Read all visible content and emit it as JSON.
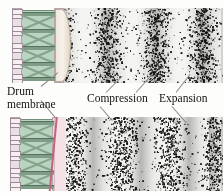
{
  "figure": {
    "type": "physics-illustration",
    "background_color": "#fdfdfc"
  },
  "labels": {
    "drum_membrane_line1": "Drum",
    "drum_membrane_line2": "membrane",
    "compression": "Compression",
    "expansion": "Expansion"
  },
  "panels": [
    {
      "id": "top",
      "name": "membrane-pushed-outward",
      "membrane_state": "bulged-outward",
      "membrane_shape": "convex",
      "membrane_color": "#efe7dd",
      "band_offset_px": 0
    },
    {
      "id": "bottom",
      "name": "membrane-pulled-inward",
      "membrane_state": "pulled-inward",
      "membrane_shape": "slanted-flat",
      "membrane_color": "#f4e2e6",
      "band_offset_px": 14
    }
  ],
  "drum": {
    "name": "drum-body",
    "shell_color": "#b9d4c0",
    "rail_color": "#eadfe4",
    "brace_color": "#86a48d",
    "hbar_color": "#7e9c86",
    "hoop_count": 4,
    "brace_cells": 4
  },
  "wave": {
    "medium": "air-particles",
    "particle_color": "#1a1a1a",
    "field_background": "#f4f4f2",
    "wavelength_px": 48,
    "compression_centers_top": [
      18,
      66,
      114,
      158
    ],
    "expansion_centers_top": [
      42,
      90,
      138
    ],
    "compression_label_points_to": "dark dense vertical band",
    "expansion_label_points_to": "light sparse vertical band"
  },
  "chart_data": {
    "type": "heatmap",
    "title": "",
    "xlabel": "",
    "ylabel": "",
    "series": [
      {
        "name": "top-panel-density",
        "values": [
          95,
          40,
          20,
          45,
          92,
          38,
          18,
          44,
          90,
          36,
          20,
          48,
          88,
          42
        ]
      },
      {
        "name": "bottom-panel-density",
        "values": [
          55,
          92,
          42,
          18,
          46,
          94,
          40,
          20,
          48,
          90,
          38,
          22,
          50,
          88
        ]
      }
    ],
    "categories": [
      "0",
      "12",
      "24",
      "36",
      "48",
      "60",
      "72",
      "84",
      "96",
      "108",
      "120",
      "132",
      "144",
      "156"
    ]
  }
}
